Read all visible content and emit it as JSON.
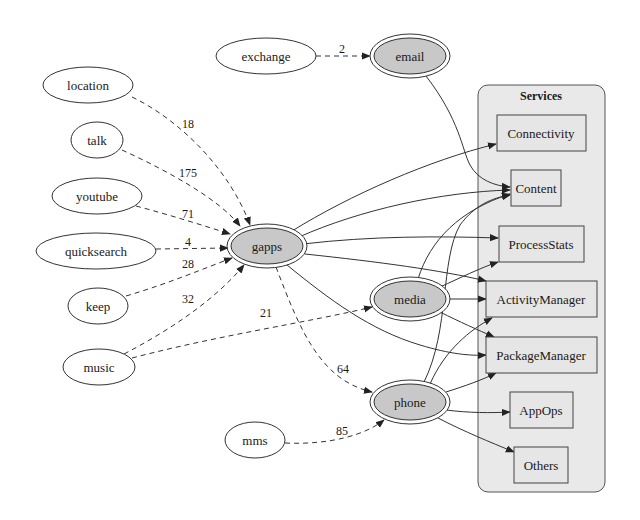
{
  "diagram": {
    "cluster": {
      "label": "Services"
    },
    "client_nodes": [
      {
        "id": "exchange",
        "label": "exchange"
      },
      {
        "id": "location",
        "label": "location"
      },
      {
        "id": "talk",
        "label": "talk"
      },
      {
        "id": "youtube",
        "label": "youtube"
      },
      {
        "id": "quicksearch",
        "label": "quicksearch"
      },
      {
        "id": "keep",
        "label": "keep"
      },
      {
        "id": "music",
        "label": "music"
      },
      {
        "id": "mms",
        "label": "mms"
      }
    ],
    "hub_nodes": [
      {
        "id": "email",
        "label": "email"
      },
      {
        "id": "gapps",
        "label": "gapps"
      },
      {
        "id": "media",
        "label": "media"
      },
      {
        "id": "phone",
        "label": "phone"
      }
    ],
    "service_nodes": [
      {
        "id": "Connectivity",
        "label": "Connectivity"
      },
      {
        "id": "Content",
        "label": "Content"
      },
      {
        "id": "ProcessStats",
        "label": "ProcessStats"
      },
      {
        "id": "ActivityManager",
        "label": "ActivityManager"
      },
      {
        "id": "PackageManager",
        "label": "PackageManager"
      },
      {
        "id": "AppOps",
        "label": "AppOps"
      },
      {
        "id": "Others",
        "label": "Others"
      }
    ],
    "dashed_edges": [
      {
        "from": "exchange",
        "to": "email",
        "label": "2"
      },
      {
        "from": "location",
        "to": "gapps",
        "label": "18"
      },
      {
        "from": "talk",
        "to": "gapps",
        "label": "175"
      },
      {
        "from": "youtube",
        "to": "gapps",
        "label": "71"
      },
      {
        "from": "quicksearch",
        "to": "gapps",
        "label": "4"
      },
      {
        "from": "keep",
        "to": "gapps",
        "label": "28"
      },
      {
        "from": "music",
        "to": "gapps",
        "label": "32"
      },
      {
        "from": "music",
        "to": "media",
        "label": "21"
      },
      {
        "from": "gapps",
        "to": "phone",
        "label": "64"
      },
      {
        "from": "mms",
        "to": "phone",
        "label": "85"
      }
    ],
    "solid_edges": [
      {
        "from": "email",
        "to": "Content"
      },
      {
        "from": "gapps",
        "to": "Connectivity"
      },
      {
        "from": "gapps",
        "to": "Content"
      },
      {
        "from": "gapps",
        "to": "ProcessStats"
      },
      {
        "from": "gapps",
        "to": "ActivityManager"
      },
      {
        "from": "gapps",
        "to": "PackageManager"
      },
      {
        "from": "media",
        "to": "Content"
      },
      {
        "from": "media",
        "to": "ProcessStats"
      },
      {
        "from": "media",
        "to": "ActivityManager"
      },
      {
        "from": "media",
        "to": "PackageManager"
      },
      {
        "from": "phone",
        "to": "Content"
      },
      {
        "from": "phone",
        "to": "ActivityManager"
      },
      {
        "from": "phone",
        "to": "PackageManager"
      },
      {
        "from": "phone",
        "to": "AppOps"
      },
      {
        "from": "phone",
        "to": "Others"
      }
    ],
    "colors": {
      "hub_fill": "#c8c8c8",
      "cluster_fill": "#e9e9e9",
      "box_fill": "#e6e6e6",
      "stroke": "#333333"
    }
  }
}
